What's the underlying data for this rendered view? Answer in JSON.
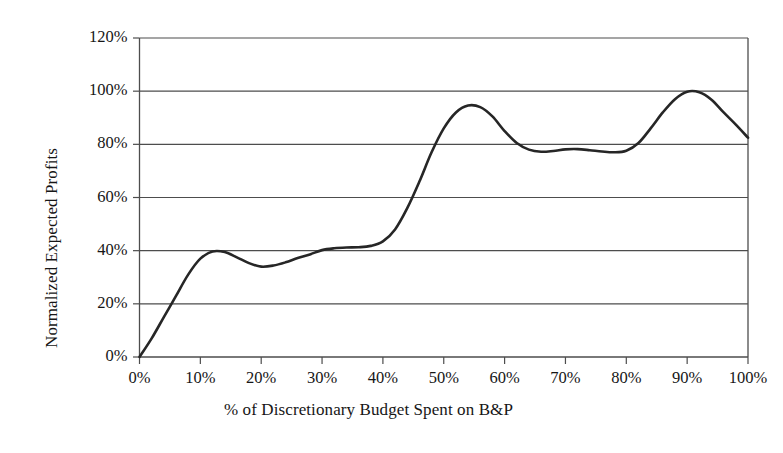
{
  "chart_data": {
    "type": "line",
    "title": "",
    "xlabel": "% of Discretionary Budget Spent on B&P",
    "ylabel": "Normalized Expected Profits",
    "xlim": [
      0,
      100
    ],
    "ylim": [
      0,
      120
    ],
    "grid": "horizontal",
    "legend": "none",
    "x_tick_labels": [
      "0%",
      "10%",
      "20%",
      "30%",
      "40%",
      "50%",
      "60%",
      "70%",
      "80%",
      "90%",
      "100%"
    ],
    "x_ticks": [
      0,
      10,
      20,
      30,
      40,
      50,
      60,
      70,
      80,
      90,
      100
    ],
    "y_tick_labels": [
      "0%",
      "20%",
      "40%",
      "60%",
      "80%",
      "100%",
      "120%"
    ],
    "y_ticks": [
      0,
      20,
      40,
      60,
      80,
      100,
      120
    ],
    "line_color": "#262626",
    "series": [
      {
        "name": "Normalized Expected Profits",
        "x": [
          0,
          2,
          4,
          6,
          8,
          10,
          12,
          14,
          16,
          18,
          20,
          22,
          24,
          26,
          28,
          30,
          32,
          34,
          36,
          38,
          40,
          42,
          44,
          46,
          48,
          50,
          52,
          54,
          56,
          58,
          60,
          62,
          64,
          66,
          68,
          70,
          72,
          74,
          76,
          78,
          80,
          82,
          84,
          86,
          88,
          90,
          92,
          94,
          96,
          98,
          100
        ],
        "values": [
          0,
          7,
          15,
          23,
          31,
          37,
          39.7,
          39.5,
          37.5,
          35.3,
          34,
          34.4,
          35.6,
          37.2,
          38.6,
          40.2,
          40.9,
          41.2,
          41.3,
          41.8,
          43.5,
          48,
          56,
          66,
          77,
          86,
          92,
          94.6,
          94,
          90.5,
          85,
          80.5,
          78,
          77.2,
          77.5,
          78.1,
          78.2,
          77.8,
          77.3,
          77,
          77.6,
          80.5,
          86,
          92,
          97,
          99.8,
          99.6,
          96.8,
          92,
          87.4,
          82.5
        ]
      }
    ]
  },
  "axis": {
    "y_title": "Normalized Expected Profits",
    "x_title": "% of Discretionary Budget Spent on B&P"
  }
}
